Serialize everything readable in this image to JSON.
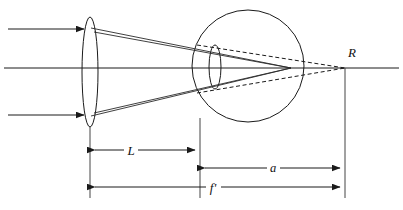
{
  "figure": {
    "type": "optical-ray-diagram",
    "title": "",
    "background_color": "#ffffff",
    "line_color": "#1a1a1a"
  },
  "labels": {
    "point_r": "R",
    "dim_l": "L",
    "dim_a": "a",
    "dim_f_prime": "f'"
  },
  "components": {
    "objective_lens": {
      "name": "objective-lens",
      "center_x": 90,
      "center_y": 72,
      "rx": 8,
      "ry": 55
    },
    "eyeball": {
      "name": "eyeball",
      "center_x": 248,
      "center_y": 66,
      "r": 56
    },
    "eye_lens": {
      "name": "eye-lens",
      "center_x": 215,
      "center_y": 67,
      "rx": 6,
      "ry": 22
    },
    "optical_axis": {
      "name": "optical-axis",
      "y": 68,
      "x_start": 4,
      "x_end": 399
    },
    "image_point_r": {
      "name": "image-point-r",
      "x": 345,
      "y": 68
    },
    "retina_focus": {
      "name": "retina-focus-point",
      "x": 291,
      "y": 68
    }
  },
  "incoming_rays": [
    {
      "name": "ray-upper",
      "y": 29,
      "x_start": 8,
      "x_end": 88
    },
    {
      "name": "ray-axis",
      "y": 68,
      "x_start": 4,
      "x_end": 88
    },
    {
      "name": "ray-lower",
      "y": 115,
      "x_start": 8,
      "x_end": 88
    }
  ],
  "dimensions": [
    {
      "name": "dimension-L",
      "label": "L",
      "y": 150,
      "x_start": 90,
      "x_end": 200,
      "label_x": 130
    },
    {
      "name": "dimension-a",
      "label": "a",
      "y": 168,
      "x_start": 200,
      "x_end": 345,
      "label_x": 273
    },
    {
      "name": "dimension-f-prime",
      "label": "f'",
      "y": 187,
      "x_start": 90,
      "x_end": 345,
      "label_x": 213
    }
  ],
  "extension_lines": [
    {
      "name": "ext-line-lens",
      "x": 90,
      "y_start": 126,
      "y_end": 198
    },
    {
      "name": "ext-line-eye-front",
      "x": 200,
      "y_start": 118,
      "y_end": 198
    },
    {
      "name": "ext-line-image-r",
      "x": 345,
      "y_start": 68,
      "y_end": 198
    }
  ]
}
